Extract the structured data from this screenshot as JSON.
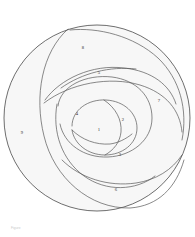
{
  "figure": {
    "type": "region-partition-diagram",
    "background_color": "#ffffff",
    "fill_color": "#f7f7f7",
    "stroke_color": "#575757",
    "outer_stroke_color": "#4a4a4a",
    "label_color": "#2a2a2a",
    "outer_circle": {
      "cx": 97,
      "cy": 118,
      "r": 93
    },
    "region_count": 9,
    "regions": [
      {
        "id": "region-1",
        "label": "1",
        "x": 99,
        "y": 130,
        "position": "center"
      },
      {
        "id": "region-2",
        "label": "2",
        "x": 123,
        "y": 120,
        "position": "center-right"
      },
      {
        "id": "region-3",
        "label": "3",
        "x": 120,
        "y": 155,
        "position": "lower-center"
      },
      {
        "id": "region-4",
        "label": "4",
        "x": 77,
        "y": 114,
        "position": "center-left"
      },
      {
        "id": "region-5",
        "label": "5",
        "x": 99,
        "y": 73,
        "position": "upper-center"
      },
      {
        "id": "region-6",
        "label": "6",
        "x": 116,
        "y": 190,
        "position": "bottom"
      },
      {
        "id": "region-7",
        "label": "7",
        "x": 159,
        "y": 101,
        "position": "right"
      },
      {
        "id": "region-8",
        "label": "8",
        "x": 83,
        "y": 48,
        "position": "top"
      },
      {
        "id": "region-9",
        "label": "9",
        "x": 22,
        "y": 133,
        "position": "left-outer"
      }
    ]
  },
  "watermark": {
    "text": "Figure"
  }
}
